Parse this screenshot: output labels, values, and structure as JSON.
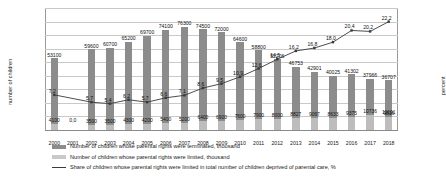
{
  "chart_data": {
    "type": "bar",
    "title": "",
    "xlabel": "",
    "ylabel": "number of children",
    "y2label": "percent",
    "categories": [
      "2000",
      "2001",
      "2002",
      "2003",
      "2004",
      "2005",
      "2006",
      "2007",
      "2008",
      "2009",
      "2010",
      "2011",
      "2012",
      "2013",
      "2014",
      "2015",
      "2016",
      "2017",
      "2018"
    ],
    "ylim": [
      0,
      90000
    ],
    "yticks": [
      "0",
      "10 000",
      "20 000",
      "30 000",
      "40 000",
      "50 000",
      "60 000",
      "70 000",
      "80 000",
      "90 000"
    ],
    "y2lim": [
      0,
      25.0
    ],
    "y2ticks": [
      "0,0",
      "5,0",
      "10,0",
      "15,0",
      "20,0",
      "25,0"
    ],
    "grid": true,
    "legend_position": "bottom",
    "series": [
      {
        "name": "Number of children whose parental rights were terminated, thousand",
        "type": "bar",
        "axis": "left",
        "color": "#8c8c8c",
        "values": [
          53100,
          null,
          59600,
          60700,
          65200,
          69700,
          74100,
          76300,
          74500,
          72000,
          64600,
          58800,
          52206,
          46753,
          42901,
          40025,
          41302,
          37966,
          36707
        ],
        "labels": [
          "53100",
          "",
          "59600",
          "60700",
          "65200",
          "69700",
          "74100",
          "76300",
          "74500",
          "72000",
          "64600",
          "58800",
          "52206",
          "46753",
          "42901",
          "40025",
          "41302",
          "37966",
          "36707"
        ]
      },
      {
        "name": "Number of children whose parental rights were limited, thousand",
        "type": "bar",
        "axis": "left",
        "color": "#bdbdbd",
        "values": [
          4100,
          null,
          3500,
          3500,
          4300,
          4200,
          5400,
          5200,
          6400,
          6900,
          7600,
          7900,
          8000,
          8827,
          9067,
          8633,
          9375,
          10736,
          9816
        ],
        "labels": [
          "4100",
          "",
          "3500",
          "3500",
          "4300",
          "4200",
          "5400",
          "5200",
          "6400",
          "6900",
          "7600",
          "7900",
          "8000",
          "8827",
          "9067",
          "8633",
          "9375",
          "10736",
          "9816"
        ],
        "extra_label": "10191"
      },
      {
        "name": "Share of children whose parental rights were limited in total number of children deprived of parental care, %",
        "type": "line",
        "axis": "right",
        "color": "#3a3a3a",
        "values": [
          7.2,
          null,
          5.7,
          5.4,
          6.2,
          5.7,
          6.6,
          7.1,
          8.6,
          9.5,
          10.9,
          12.6,
          14.5,
          16.2,
          16.8,
          18.0,
          20.4,
          20.2,
          22.2
        ],
        "labels": [
          "7,2",
          "0,0",
          "5,7",
          "5,4",
          "6,2",
          "5,7",
          "6,6",
          "7,1",
          "8,6",
          "9,5",
          "10,9",
          "12,6",
          "14,5",
          "16,2",
          "16,8",
          "18,0",
          "20,4",
          "20,2",
          "22,2"
        ]
      }
    ],
    "annotations": [
      {
        "text": "0,0",
        "note": "zero marker at 2001 gap"
      }
    ]
  }
}
